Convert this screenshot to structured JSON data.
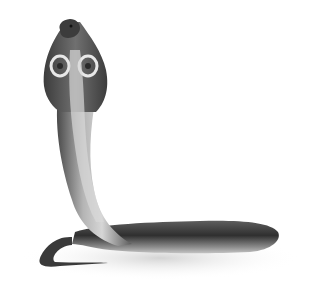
{
  "image": {
    "subject": "Cobra with raised hood, body coiled on the ground",
    "style": "grayscale illustration",
    "background_color": "#ffffff",
    "colors": {
      "body_dark": "#2e2e2e",
      "body_mid": "#6b6b6b",
      "belly_light": "#cfcfcf",
      "hood_marking": "#e8e8e8",
      "shadow": "#dcdcdc"
    }
  },
  "caption": {
    "text": "",
    "note": "caption text cut off at bottom edge, illegible"
  }
}
